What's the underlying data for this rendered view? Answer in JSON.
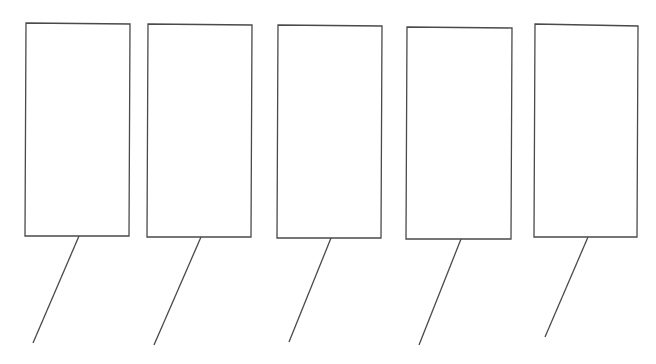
{
  "diagram": {
    "stroke_color": "#4a4a4a",
    "background_color": "#ffffff",
    "panels": [
      {
        "id": 1,
        "label": "",
        "box": [
          [
            26,
            23
          ],
          [
            130,
            24
          ],
          [
            129,
            236
          ],
          [
            25,
            236
          ]
        ],
        "stem": [
          [
            79,
            236
          ],
          [
            33,
            343
          ]
        ]
      },
      {
        "id": 2,
        "label": "",
        "box": [
          [
            148,
            24
          ],
          [
            252,
            25
          ],
          [
            251,
            237
          ],
          [
            147,
            237
          ]
        ],
        "stem": [
          [
            201,
            237
          ],
          [
            154,
            345
          ]
        ]
      },
      {
        "id": 3,
        "label": "",
        "box": [
          [
            278,
            25
          ],
          [
            382,
            26
          ],
          [
            381,
            238
          ],
          [
            277,
            238
          ]
        ],
        "stem": [
          [
            331,
            238
          ],
          [
            289,
            342
          ]
        ]
      },
      {
        "id": 4,
        "label": "",
        "box": [
          [
            407,
            27
          ],
          [
            512,
            28
          ],
          [
            511,
            239
          ],
          [
            406,
            239
          ]
        ],
        "stem": [
          [
            461,
            239
          ],
          [
            419,
            345
          ]
        ]
      },
      {
        "id": 5,
        "label": "",
        "box": [
          [
            535,
            24
          ],
          [
            638,
            26
          ],
          [
            637,
            237
          ],
          [
            534,
            237
          ]
        ],
        "stem": [
          [
            588,
            237
          ],
          [
            545,
            337
          ]
        ]
      }
    ]
  }
}
